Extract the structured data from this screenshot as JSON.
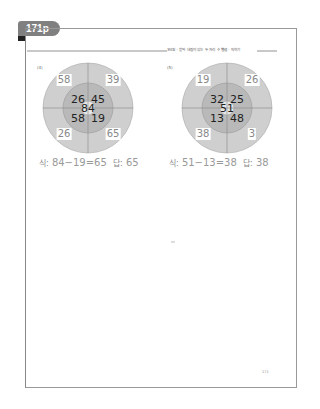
{
  "page_tab": "171p",
  "header_title": "3단원 · 받아 내림이 있는 두 자리 수 뺄셈 · 익히기",
  "page_number": "171",
  "problems": [
    {
      "label": "(4)",
      "center": "84",
      "inner": {
        "top_left": "26",
        "top_right": "45",
        "bottom_left": "58",
        "bottom_right": "19"
      },
      "outer": {
        "top_left": "58",
        "top_right": "39",
        "bottom_left": "26",
        "bottom_right": "65"
      },
      "equation_label": "식:",
      "equation": "84−19=65",
      "answer_label": "답:",
      "answer": "65"
    },
    {
      "label": "(5)",
      "center": "51",
      "inner": {
        "top_left": "32",
        "top_right": "25",
        "bottom_left": "13",
        "bottom_right": "48"
      },
      "outer": {
        "top_left": "19",
        "top_right": "26",
        "bottom_left": "38",
        "bottom_right": "3"
      },
      "equation_label": "식:",
      "equation": "51−13=38",
      "answer_label": "답:",
      "answer": "38"
    }
  ],
  "colors": {
    "outer_ring": "#cfcfcf",
    "inner_ring": "#b9b9b9",
    "center": "#e6e6e6",
    "tab": "#808080",
    "answer_text": "#999999"
  }
}
